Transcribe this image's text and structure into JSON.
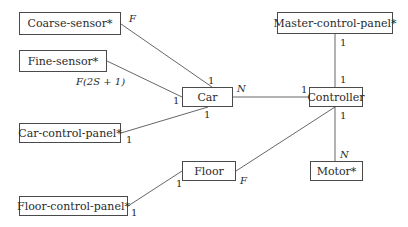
{
  "entities": {
    "coarse_sensor": "Coarse-sensor*",
    "fine_sensor": "Fine-sensor*",
    "car": "Car",
    "car_control_panel": "Car-control-panel*",
    "controller": "Controller",
    "master_control_panel": "Master-control-panel*",
    "motor": "Motor*",
    "floor": "Floor",
    "floor_control_panel": "Floor-control-panel*"
  },
  "multiplicities": {
    "coarse_sensor_end": "F",
    "coarse_car_end": "1",
    "fine_sensor_end": "F(2S + 1)",
    "fine_car_end": "1",
    "car_controller_car_end": "N",
    "car_controller_controller_end": "1",
    "car_panel_car_end": "1",
    "car_panel_panel_end": "1",
    "master_master_end": "1",
    "master_controller_end": "1",
    "motor_controller_end": "1",
    "motor_motor_end": "N",
    "floor_controller_end": "F",
    "floor_panel_floor_end": "1",
    "floor_panel_panel_end": "1"
  },
  "colors": {
    "line": "#555555",
    "box_border": "#4a4a4a",
    "text": "#2a2a2a"
  }
}
